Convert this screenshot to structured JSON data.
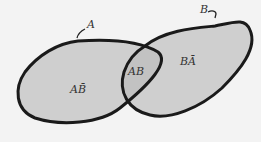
{
  "diagram": {
    "type": "venn",
    "sets": [
      {
        "name": "A",
        "label": "A"
      },
      {
        "name": "B",
        "label": "B"
      }
    ],
    "regions": {
      "a_not_b": "AB̄",
      "a_and_b": "AB",
      "b_not_a": "BĀ"
    },
    "colors": {
      "background": "#f3f3f3",
      "fill": "#cfcfcf",
      "intersection_fill": "#c2c2c2",
      "stroke": "#1a1a1a"
    }
  }
}
